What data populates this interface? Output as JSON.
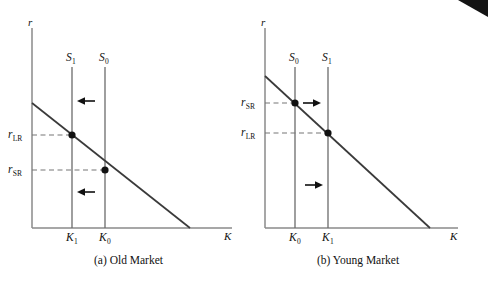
{
  "figure": {
    "panels": [
      {
        "id": "old-market",
        "caption": "(a) Old Market",
        "y_axis_label": "r",
        "x_axis_label": "K",
        "curves": [
          {
            "name": "supply-1",
            "label_base": "S",
            "label_sub": "1"
          },
          {
            "name": "supply-0",
            "label_base": "S",
            "label_sub": "0"
          }
        ],
        "rate_ticks": [
          {
            "name": "r-LR",
            "base": "r",
            "sub": "LR"
          },
          {
            "name": "r-SR",
            "base": "r",
            "sub": "SR"
          }
        ],
        "capital_ticks": [
          {
            "name": "K-1",
            "base": "K",
            "sub": "1"
          },
          {
            "name": "K-0",
            "base": "K",
            "sub": "0"
          }
        ],
        "arrows": [
          {
            "name": "shift-arrow-upper",
            "direction": "left"
          },
          {
            "name": "shift-arrow-lower",
            "direction": "left"
          }
        ]
      },
      {
        "id": "young-market",
        "caption": "(b) Young Market",
        "y_axis_label": "r",
        "x_axis_label": "K",
        "curves": [
          {
            "name": "supply-0",
            "label_base": "S",
            "label_sub": "0"
          },
          {
            "name": "supply-1",
            "label_base": "S",
            "label_sub": "1"
          }
        ],
        "rate_ticks": [
          {
            "name": "r-SR",
            "base": "r",
            "sub": "SR"
          },
          {
            "name": "r-LR",
            "base": "r",
            "sub": "LR"
          }
        ],
        "capital_ticks": [
          {
            "name": "K-0",
            "base": "K",
            "sub": "0"
          },
          {
            "name": "K-1",
            "base": "K",
            "sub": "1"
          }
        ],
        "arrows": [
          {
            "name": "shift-arrow-upper",
            "direction": "right"
          },
          {
            "name": "shift-arrow-lower",
            "direction": "right"
          }
        ]
      }
    ],
    "colors": {
      "axis": "#8a8a8a",
      "curve": "#555555",
      "demand": "#3a3a3a",
      "dashed": "#777777",
      "arrow": "#111111",
      "text": "#111111",
      "background": "#ffffff",
      "corner_artifact": "#141414"
    }
  }
}
